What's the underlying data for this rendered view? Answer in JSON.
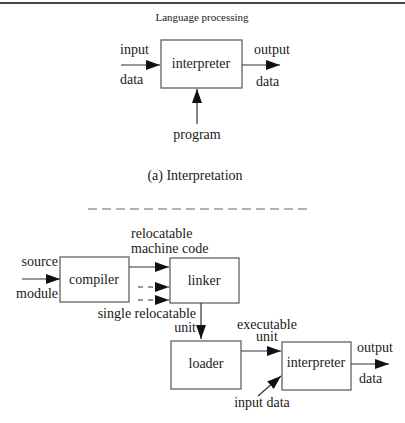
{
  "header": {
    "title": "Language processing"
  },
  "part_a": {
    "caption": "(a) Interpretation",
    "box": "interpreter",
    "input_top": "input",
    "input_bottom": "data",
    "output_top": "output",
    "output_bottom": "data",
    "program": "program"
  },
  "part_b": {
    "source_top": "source",
    "source_bottom": "module",
    "compiler": "compiler",
    "reloc_line1": "relocatable",
    "reloc_line2": "machine code",
    "linker": "linker",
    "single_line1": "single relocatable",
    "single_line2": "unit",
    "loader": "loader",
    "exec_line1": "executable",
    "exec_line2": "unit",
    "interpreter": "interpreter",
    "output_top": "output",
    "output_bottom": "data",
    "input_data": "input data"
  }
}
